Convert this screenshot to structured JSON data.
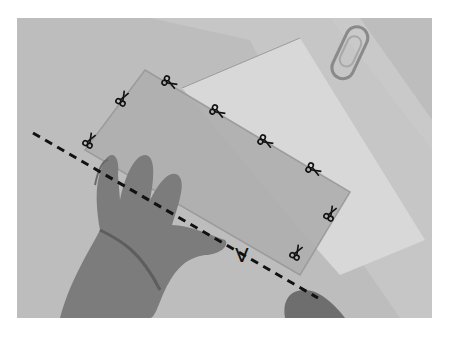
{
  "figure": {
    "type": "grayscale-photo",
    "fold_label": "V",
    "colors": {
      "table": "#bdbdbd",
      "paper_back": "#cacaca",
      "paper_white": "#dcdcdc",
      "sheet": "#b3b3b3",
      "sheet_edge": "#a0a0a0",
      "hand": "#7a7a7a",
      "hand_dark": "#5e5e5e",
      "ink": "#111111"
    },
    "scissor_icons": [
      {
        "x": 170,
        "y": 83,
        "rot": 30
      },
      {
        "x": 123,
        "y": 98,
        "rot": -60
      },
      {
        "x": 90,
        "y": 140,
        "rot": -60
      },
      {
        "x": 218,
        "y": 112,
        "rot": 30
      },
      {
        "x": 266,
        "y": 142,
        "rot": 30
      },
      {
        "x": 314,
        "y": 170,
        "rot": 30
      },
      {
        "x": 331,
        "y": 213,
        "rot": -60
      },
      {
        "x": 297,
        "y": 252,
        "rot": -60
      }
    ],
    "dashed_line": {
      "x1": 33,
      "y1": 133,
      "x2": 318,
      "y2": 298
    }
  },
  "caption": {
    "text": ""
  }
}
